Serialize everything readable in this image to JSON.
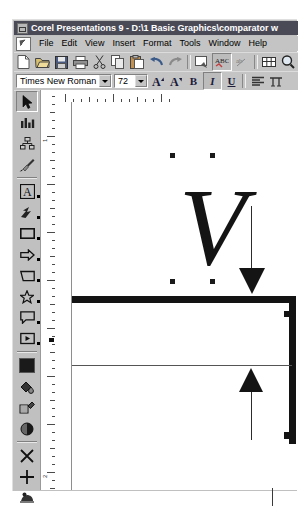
{
  "window": {
    "title": "Corel Presentations 9 - D:\\1 Basic Graphics\\comparator w",
    "sysmenu_icon": "system-menu-icon"
  },
  "menubar": {
    "doc_icon": "document-edit-icon",
    "items": [
      {
        "label": "File"
      },
      {
        "label": "Edit"
      },
      {
        "label": "View"
      },
      {
        "label": "Insert"
      },
      {
        "label": "Format"
      },
      {
        "label": "Tools"
      },
      {
        "label": "Window"
      },
      {
        "label": "Help"
      }
    ]
  },
  "toolbar": {
    "buttons": [
      {
        "name": "new-icon",
        "title": "New"
      },
      {
        "name": "open-folder-icon",
        "title": "Open"
      },
      {
        "name": "save-disk-icon",
        "title": "Save"
      },
      {
        "name": "print-icon",
        "title": "Print"
      },
      {
        "name": "cut-scissors-icon",
        "title": "Cut"
      },
      {
        "name": "copy-icon",
        "title": "Copy"
      },
      {
        "name": "paste-clipboard-icon",
        "title": "Paste"
      },
      {
        "name": "undo-arrow-icon",
        "title": "Undo"
      },
      {
        "name": "redo-arrow-icon",
        "title": "Redo"
      },
      {
        "name": "quickview-icon",
        "title": "QuickView"
      },
      {
        "name": "spellcheck-icon",
        "title": "Spell Check"
      },
      {
        "name": "quickcorrect-icon",
        "title": "QuickCorrect"
      },
      {
        "name": "table-grid-icon",
        "title": "Table"
      },
      {
        "name": "zoom-magnifier-icon",
        "title": "Zoom"
      }
    ]
  },
  "propertybar": {
    "font_name": "Times New Roman",
    "font_size": "72",
    "buttons": [
      {
        "name": "font-size-increase-icon",
        "label": "A"
      },
      {
        "name": "font-size-decrease-icon",
        "label": "A"
      },
      {
        "name": "bold-icon",
        "label": "B"
      },
      {
        "name": "italic-icon",
        "label": "I"
      },
      {
        "name": "underline-icon",
        "label": "U"
      },
      {
        "name": "align-icon",
        "label": ""
      },
      {
        "name": "text-options-icon",
        "label": ""
      }
    ]
  },
  "toolpalette": {
    "tools": [
      {
        "name": "pointer-tool",
        "label": "Select",
        "selected": true
      },
      {
        "name": "chart-tool",
        "label": "Chart",
        "selected": false
      },
      {
        "name": "org-chart-tool",
        "label": "Organization Chart",
        "selected": false
      },
      {
        "name": "brush-tool",
        "label": "Draw Picture",
        "selected": false
      },
      {
        "name": "text-tool",
        "label": "Text",
        "selected": false
      },
      {
        "name": "freehand-line-tool",
        "label": "Freehand Line",
        "selected": false
      },
      {
        "name": "rectangle-tool",
        "label": "Rectangle",
        "selected": false
      },
      {
        "name": "arrow-shape-tool",
        "label": "Arrow Shape",
        "selected": false
      },
      {
        "name": "polygon-tool",
        "label": "Polygon",
        "selected": false
      },
      {
        "name": "star-tool",
        "label": "Star",
        "selected": false
      },
      {
        "name": "callout-tool",
        "label": "Callout",
        "selected": false
      },
      {
        "name": "action-tool",
        "label": "Action",
        "selected": false
      },
      {
        "name": "fill-color-tool",
        "label": "Fill Color",
        "selected": false
      },
      {
        "name": "object-fill-tool",
        "label": "Object Fill",
        "selected": false
      },
      {
        "name": "pattern-fill-tool",
        "label": "Pattern Fill",
        "selected": false
      },
      {
        "name": "shadow-fill-tool",
        "label": "Shadow",
        "selected": false
      },
      {
        "name": "no-fill-tool",
        "label": "No Fill",
        "selected": false
      },
      {
        "name": "crosshair-tool",
        "label": "Crosshair",
        "selected": false
      },
      {
        "name": "clipart-tool",
        "label": "Clipart",
        "selected": false
      }
    ]
  },
  "slide": {
    "text_object": {
      "character": "V",
      "font_size_px": 110
    },
    "selection_handles": [
      {
        "x": 115,
        "y": 51
      },
      {
        "x": 155,
        "y": 51
      },
      {
        "x": 115,
        "y": 177
      },
      {
        "x": 155,
        "y": 177
      }
    ],
    "shapes": [
      {
        "name": "horizontal-rule-thick",
        "label": "Thick horizontal baseline"
      },
      {
        "name": "vertical-rule-thick",
        "label": "Thick vertical right edge"
      },
      {
        "name": "horizontal-rule-thin",
        "label": "Thin horizontal reference line"
      },
      {
        "name": "down-arrow",
        "label": "Down arrow"
      },
      {
        "name": "up-arrow",
        "label": "Up arrow"
      }
    ]
  }
}
